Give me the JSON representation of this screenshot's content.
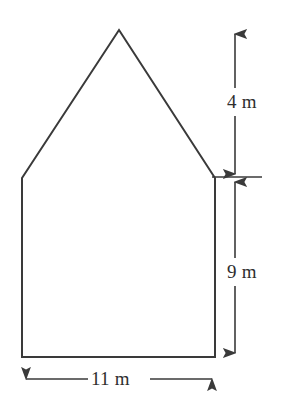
{
  "figure": {
    "kind": "composite-shape-diagram",
    "stroke_color": "#3a3a3a",
    "text_color": "#2e2e2e",
    "background_color": "#ffffff",
    "stroke_width": 2
  },
  "shape": {
    "name": "house-pentagon",
    "vertices": [
      {
        "name": "apex",
        "x": 119,
        "y": 30
      },
      {
        "name": "right-eave",
        "x": 215,
        "y": 178
      },
      {
        "name": "bottom-right",
        "x": 215,
        "y": 357
      },
      {
        "name": "bottom-left",
        "x": 22,
        "y": 357
      },
      {
        "name": "left-eave",
        "x": 22,
        "y": 178
      }
    ]
  },
  "dimensions": [
    {
      "id": "roof-height",
      "label": "4 m",
      "value": 4,
      "unit": "m",
      "orientation": "vertical",
      "arrows": "both",
      "x": 235,
      "y_start": 30,
      "y_end": 178
    },
    {
      "id": "wall-height",
      "label": "9 m",
      "value": 9,
      "unit": "m",
      "orientation": "vertical",
      "arrows": "both",
      "x": 235,
      "y_start": 178,
      "y_end": 357
    },
    {
      "id": "base-width",
      "label": "11 m",
      "value": 11,
      "unit": "m",
      "orientation": "horizontal",
      "arrows": "both",
      "y": 379,
      "x_start": 22,
      "x_end": 216
    }
  ],
  "extension_lines": [
    {
      "id": "eave-tick",
      "orientation": "horizontal",
      "y": 177,
      "x_start": 212,
      "x_end": 262
    }
  ],
  "labels": {
    "roof_height": "4 m",
    "wall_height": "9 m",
    "base_width": "11 m"
  }
}
